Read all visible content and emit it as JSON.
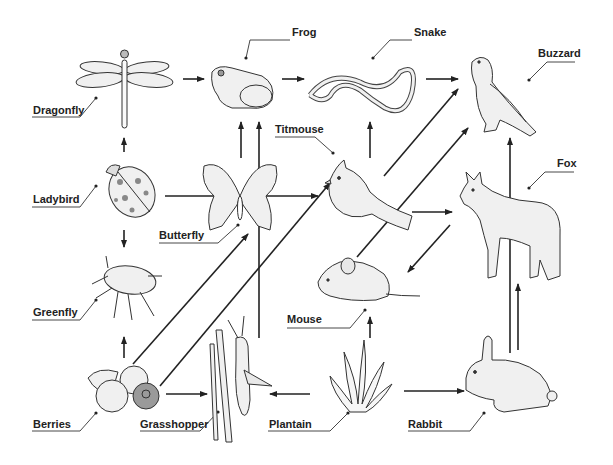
{
  "diagram": {
    "type": "food-web",
    "colors": {
      "stroke": "#222222",
      "fill": "#eeeeee",
      "berry_blue": "#9a9a9a"
    },
    "organisms": [
      {
        "id": "dragonfly",
        "label": "Dragonfly",
        "icon": "dragonfly-icon"
      },
      {
        "id": "frog",
        "label": "Frog",
        "icon": "frog-icon"
      },
      {
        "id": "snake",
        "label": "Snake",
        "icon": "snake-icon"
      },
      {
        "id": "buzzard",
        "label": "Buzzard",
        "icon": "buzzard-icon"
      },
      {
        "id": "ladybird",
        "label": "Ladybird",
        "icon": "ladybird-icon"
      },
      {
        "id": "butterfly",
        "label": "Butterfly",
        "icon": "butterfly-icon"
      },
      {
        "id": "titmouse",
        "label": "Titmouse",
        "icon": "titmouse-icon"
      },
      {
        "id": "fox",
        "label": "Fox",
        "icon": "fox-icon"
      },
      {
        "id": "greenfly",
        "label": "Greenfly",
        "icon": "greenfly-icon"
      },
      {
        "id": "mouse",
        "label": "Mouse",
        "icon": "mouse-icon"
      },
      {
        "id": "berries",
        "label": "Berries",
        "icon": "berries-icon"
      },
      {
        "id": "grasshopper",
        "label": "Grasshopper",
        "icon": "grasshopper-icon"
      },
      {
        "id": "plantain",
        "label": "Plantain",
        "icon": "plantain-icon"
      },
      {
        "id": "rabbit",
        "label": "Rabbit",
        "icon": "rabbit-icon"
      }
    ],
    "edges": [
      {
        "from": "dragonfly",
        "to": "frog"
      },
      {
        "from": "frog",
        "to": "snake"
      },
      {
        "from": "snake",
        "to": "buzzard"
      },
      {
        "from": "ladybird",
        "to": "dragonfly"
      },
      {
        "from": "ladybird",
        "to": "greenfly"
      },
      {
        "from": "ladybird",
        "to": "titmouse"
      },
      {
        "from": "butterfly",
        "to": "frog"
      },
      {
        "from": "grasshopper",
        "to": "frog"
      },
      {
        "from": "titmouse",
        "to": "snake"
      },
      {
        "from": "titmouse",
        "to": "buzzard"
      },
      {
        "from": "titmouse",
        "to": "fox"
      },
      {
        "from": "mouse",
        "to": "buzzard"
      },
      {
        "from": "fox",
        "to": "mouse"
      },
      {
        "from": "greenfly",
        "to": "berries"
      },
      {
        "from": "berries",
        "to": "butterfly"
      },
      {
        "from": "berries",
        "to": "titmouse"
      },
      {
        "from": "berries",
        "to": "grasshopper"
      },
      {
        "from": "plantain",
        "to": "grasshopper"
      },
      {
        "from": "plantain",
        "to": "mouse"
      },
      {
        "from": "plantain",
        "to": "rabbit"
      },
      {
        "from": "rabbit",
        "to": "fox"
      },
      {
        "from": "rabbit",
        "to": "buzzard"
      }
    ]
  }
}
